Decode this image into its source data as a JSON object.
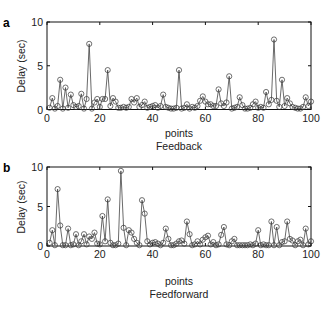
{
  "chart_data": [
    {
      "type": "line",
      "panel_label": "a",
      "title": "",
      "xlabel": "points",
      "subtitle": "Feedback",
      "ylabel": "Delay (sec)",
      "xlim": [
        0,
        100
      ],
      "ylim": [
        0,
        10
      ],
      "xticks": [
        0,
        20,
        40,
        60,
        80,
        100
      ],
      "yticks": [
        0,
        5,
        10
      ],
      "grid": false,
      "marker": "circle",
      "series": [
        {
          "name": "Feedback",
          "x": [
            1,
            2,
            3,
            4,
            5,
            6,
            7,
            8,
            9,
            10,
            11,
            12,
            13,
            14,
            15,
            16,
            17,
            18,
            19,
            20,
            21,
            22,
            23,
            24,
            25,
            26,
            27,
            28,
            29,
            30,
            31,
            32,
            33,
            34,
            35,
            36,
            37,
            38,
            39,
            40,
            41,
            42,
            43,
            44,
            45,
            46,
            47,
            48,
            49,
            50,
            51,
            52,
            53,
            54,
            55,
            56,
            57,
            58,
            59,
            60,
            61,
            62,
            63,
            64,
            65,
            66,
            67,
            68,
            69,
            70,
            71,
            72,
            73,
            74,
            75,
            76,
            77,
            78,
            79,
            80,
            81,
            82,
            83,
            84,
            85,
            86,
            87,
            88,
            89,
            90,
            91,
            92,
            93,
            94,
            95,
            96,
            97,
            98,
            99,
            100
          ],
          "values": [
            0.2,
            1.3,
            0.1,
            0.4,
            3.4,
            0.1,
            2.5,
            0.2,
            1.7,
            0.5,
            0.3,
            0.4,
            1.8,
            0.1,
            1.2,
            7.5,
            0.1,
            0.8,
            1.2,
            0.3,
            1.2,
            1.2,
            4.5,
            0.4,
            1.3,
            0.9,
            0.2,
            0.2,
            0.3,
            0.2,
            0.3,
            1.2,
            0.8,
            1.3,
            0.3,
            0.5,
            0.9,
            0.2,
            0.3,
            0.4,
            0.5,
            0.2,
            0.4,
            1.7,
            0.3,
            0.2,
            0.1,
            0.1,
            0.2,
            4.5,
            0.1,
            0.2,
            0.6,
            0.1,
            0.3,
            0.2,
            0.4,
            1.0,
            1.5,
            0.9,
            0.6,
            0.6,
            0.4,
            0.4,
            2.3,
            0.7,
            0.4,
            0.8,
            3.8,
            0.1,
            0.2,
            0.3,
            1.4,
            0.5,
            0.1,
            0.1,
            0.2,
            0.6,
            0.9,
            0.2,
            0.3,
            0.2,
            2.0,
            0.6,
            1.1,
            8.0,
            1.0,
            0.3,
            3.4,
            0.4,
            1.3,
            0.7,
            0.3,
            0.2,
            0.1,
            0.1,
            0.3,
            1.4,
            0.4,
            0.9
          ]
        }
      ]
    },
    {
      "type": "line",
      "panel_label": "b",
      "title": "",
      "xlabel": "points",
      "subtitle": "Feedforward",
      "ylabel": "Delay (sec)",
      "xlim": [
        0,
        100
      ],
      "ylim": [
        0,
        10
      ],
      "xticks": [
        0,
        20,
        40,
        60,
        80,
        100
      ],
      "yticks": [
        0,
        5,
        10
      ],
      "grid": false,
      "marker": "circle",
      "series": [
        {
          "name": "Feedforward",
          "x": [
            1,
            2,
            3,
            4,
            5,
            6,
            7,
            8,
            9,
            10,
            11,
            12,
            13,
            14,
            15,
            16,
            17,
            18,
            19,
            20,
            21,
            22,
            23,
            24,
            25,
            26,
            27,
            28,
            29,
            30,
            31,
            32,
            33,
            34,
            35,
            36,
            37,
            38,
            39,
            40,
            41,
            42,
            43,
            44,
            45,
            46,
            47,
            48,
            49,
            50,
            51,
            52,
            53,
            54,
            55,
            56,
            57,
            58,
            59,
            60,
            61,
            62,
            63,
            64,
            65,
            66,
            67,
            68,
            69,
            70,
            71,
            72,
            73,
            74,
            75,
            76,
            77,
            78,
            79,
            80,
            81,
            82,
            83,
            84,
            85,
            86,
            87,
            88,
            89,
            90,
            91,
            92,
            93,
            94,
            95,
            96,
            97,
            98,
            99,
            100
          ],
          "values": [
            0.4,
            2.0,
            0.1,
            7.2,
            2.6,
            0.1,
            0.1,
            2.2,
            0.1,
            0.2,
            1.5,
            0.1,
            0.6,
            1.5,
            0.2,
            1.2,
            0.9,
            1.7,
            0.3,
            0.2,
            3.8,
            0.6,
            5.9,
            0.4,
            0.1,
            0.1,
            0.3,
            9.5,
            2.3,
            0.1,
            2.0,
            1.7,
            0.9,
            0.4,
            0.1,
            5.8,
            4.1,
            0.6,
            0.2,
            0.4,
            0.5,
            0.3,
            0.1,
            0.4,
            2.2,
            0.9,
            0.1,
            0.1,
            0.3,
            0.6,
            0.7,
            0.3,
            3.1,
            1.5,
            0.1,
            0.2,
            0.6,
            0.2,
            0.8,
            1.1,
            1.3,
            0.2,
            0.5,
            0.1,
            0.2,
            1.4,
            2.4,
            0.2,
            0.1,
            0.6,
            0.9,
            0.1,
            0.1,
            0.1,
            0.1,
            0.1,
            0.2,
            0.1,
            0.3,
            2.0,
            0.1,
            0.2,
            0.1,
            0.1,
            3.1,
            0.1,
            2.4,
            0.1,
            0.5,
            0.6,
            3.1,
            0.9,
            0.7,
            0.1,
            0.6,
            0.8,
            0.1,
            2.2,
            0.2,
            0.6
          ]
        }
      ]
    }
  ],
  "panels": [
    {
      "label": "a",
      "xlabel": "points",
      "subtitle": "Feedback",
      "ylabel": "Delay (sec)"
    },
    {
      "label": "b",
      "xlabel": "points",
      "subtitle": "Feedforward",
      "ylabel": "Delay (sec)"
    }
  ],
  "colors": {
    "line": "#444444",
    "marker_edge": "#333333",
    "axis": "#111111",
    "text": "#222222"
  }
}
